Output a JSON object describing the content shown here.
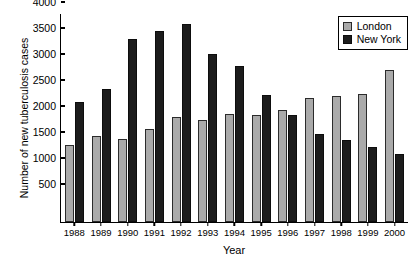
{
  "chart_data": {
    "type": "bar",
    "title": "",
    "xlabel": "Year",
    "ylabel": "Number of new tuberculosis cases",
    "categories": [
      "1988",
      "1989",
      "1990",
      "1991",
      "1992",
      "1993",
      "1994",
      "1995",
      "1996",
      "1997",
      "1998",
      "1999",
      "2000"
    ],
    "series": [
      {
        "name": "London",
        "color": "#aaaaaa",
        "values": [
          1490,
          1650,
          1590,
          1790,
          2010,
          1960,
          2070,
          2050,
          2150,
          2390,
          2430,
          2470,
          2930
        ]
      },
      {
        "name": "New York",
        "color": "#1c1c1c",
        "values": [
          2300,
          2550,
          3520,
          3670,
          3810,
          3230,
          3000,
          2440,
          2050,
          1690,
          1570,
          1440,
          1300
        ]
      }
    ],
    "ylim": [
      0,
      4000
    ],
    "yticks": [
      500,
      1000,
      1500,
      2000,
      2500,
      3000,
      3500,
      4000
    ],
    "grid": false,
    "legend_position": "top-right"
  },
  "legend": {
    "entries": [
      {
        "label": "London"
      },
      {
        "label": "New York"
      }
    ]
  }
}
